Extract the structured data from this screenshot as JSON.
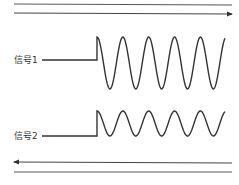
{
  "diagram": {
    "type": "signal-waveform",
    "top_rails": {
      "direction": "right",
      "arrow": "right-arrow"
    },
    "bottom_rails": {
      "direction": "left",
      "arrow": "left-arrow"
    },
    "signals": [
      {
        "label": "信号1",
        "waveform": "sine",
        "cycles": 5,
        "amplitude": "large"
      },
      {
        "label": "信号2",
        "waveform": "sine",
        "cycles": 5,
        "amplitude": "small"
      }
    ],
    "colors": {
      "line": "#333333",
      "rail": "#555555"
    }
  }
}
